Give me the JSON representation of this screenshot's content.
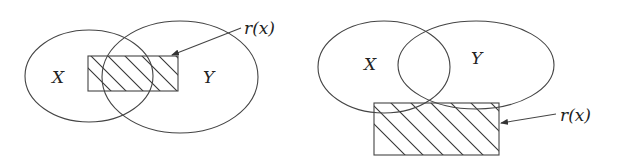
{
  "diagram": {
    "type": "venn-with-region",
    "panels": [
      {
        "id": "left",
        "sets": [
          {
            "label": "X",
            "cx": 89,
            "cy": 76,
            "rx": 64,
            "ry": 46
          },
          {
            "label": "Y",
            "cx": 180,
            "cy": 77,
            "rx": 78,
            "ry": 56
          }
        ],
        "region": {
          "label": "r(x)",
          "x": 88,
          "y": 56,
          "width": 90,
          "height": 35,
          "fill": "hatched"
        },
        "arrow": {
          "from": [
            241,
            28
          ],
          "to": [
            171,
            55
          ]
        },
        "label_pos": {
          "x": 244,
          "y": 34
        }
      },
      {
        "id": "right",
        "sets": [
          {
            "label": "X",
            "cx": 384,
            "cy": 67,
            "rx": 66,
            "ry": 46
          },
          {
            "label": "Y",
            "cx": 476,
            "cy": 65,
            "rx": 78,
            "ry": 44
          }
        ],
        "region": {
          "label": "r(x)",
          "x": 374,
          "y": 103,
          "width": 125,
          "height": 52,
          "fill": "hatched"
        },
        "arrow": {
          "from": [
            556,
            114
          ],
          "to": [
            500,
            123
          ]
        },
        "label_pos": {
          "x": 560,
          "y": 121
        }
      }
    ]
  },
  "labels": {
    "left": {
      "x": "X",
      "y": "Y",
      "r": "r(x)"
    },
    "right": {
      "x": "X",
      "y": "Y",
      "r": "r(x)"
    }
  },
  "colors": {
    "stroke": "#444444",
    "text": "#222222",
    "background": "#ffffff"
  }
}
